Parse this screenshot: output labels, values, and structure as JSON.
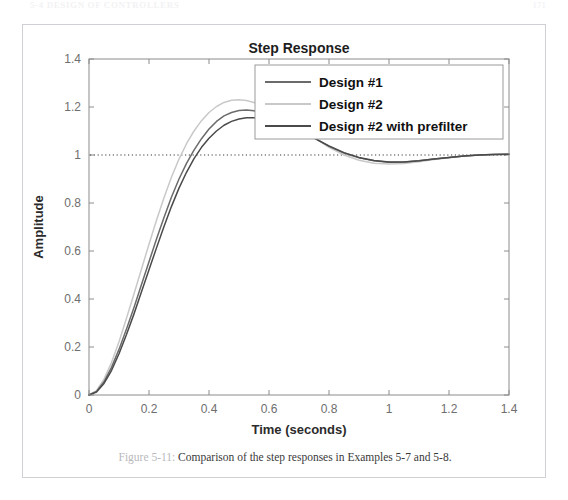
{
  "page_header": {
    "left_text": "5-4  DESIGN OF CONTROLLERS",
    "right_text": "171"
  },
  "caption": {
    "figure_label": "Figure 5-11:",
    "text": " Comparison of the step responses in Examples 5-7 and 5-8."
  },
  "colors": {
    "design1": "#6b6b6b",
    "design2": "#c9c9c9",
    "design2_prefilter": "#4a4a4a",
    "axis": "#8c8c8c",
    "grid": "#d8d8d8",
    "reference_line": "#3a3a3a",
    "frame": "#cfcfd4"
  },
  "chart_data": {
    "type": "line",
    "title": "Step Response",
    "xlabel": "Time (seconds)",
    "ylabel": "Amplitude",
    "xlim": [
      0,
      1.4
    ],
    "ylim": [
      0,
      1.4
    ],
    "xticks": [
      0,
      0.2,
      0.4,
      0.6,
      0.8,
      1,
      1.2,
      1.4
    ],
    "xtick_labels": [
      "0",
      "0.2",
      "0.4",
      "0.6",
      "0.8",
      "1",
      "1.2",
      "1.4"
    ],
    "yticks": [
      0,
      0.2,
      0.4,
      0.6,
      0.8,
      1,
      1.2,
      1.4
    ],
    "ytick_labels": [
      "0",
      "0.2",
      "0.4",
      "0.6",
      "0.8",
      "1",
      "1.2",
      "1.4"
    ],
    "grid": false,
    "legend_position": "top-right",
    "annotations": [
      {
        "type": "horizontal-reference-line",
        "y": 1,
        "style": "dotted"
      }
    ],
    "x": [
      0,
      0.025,
      0.05,
      0.075,
      0.1,
      0.125,
      0.15,
      0.175,
      0.2,
      0.225,
      0.25,
      0.275,
      0.3,
      0.325,
      0.35,
      0.375,
      0.4,
      0.425,
      0.45,
      0.475,
      0.5,
      0.525,
      0.55,
      0.6,
      0.65,
      0.7,
      0.75,
      0.8,
      0.85,
      0.9,
      0.95,
      1.0,
      1.05,
      1.1,
      1.15,
      1.2,
      1.25,
      1.3,
      1.35,
      1.4
    ],
    "series": [
      {
        "name": "Design #1",
        "color": "#6b6b6b",
        "values": [
          0,
          0.015,
          0.055,
          0.115,
          0.19,
          0.275,
          0.365,
          0.46,
          0.555,
          0.65,
          0.74,
          0.825,
          0.9,
          0.965,
          1.02,
          1.068,
          1.108,
          1.14,
          1.163,
          1.177,
          1.185,
          1.187,
          1.184,
          1.168,
          1.142,
          1.108,
          1.072,
          1.036,
          1.008,
          0.988,
          0.976,
          0.97,
          0.971,
          0.976,
          0.983,
          0.99,
          0.996,
          1.0,
          1.002,
          1.003
        ]
      },
      {
        "name": "Design #2",
        "color": "#c9c9c9",
        "values": [
          0,
          0.018,
          0.066,
          0.135,
          0.222,
          0.32,
          0.422,
          0.525,
          0.628,
          0.728,
          0.822,
          0.908,
          0.983,
          1.047,
          1.1,
          1.143,
          1.177,
          1.202,
          1.219,
          1.228,
          1.23,
          1.227,
          1.219,
          1.193,
          1.157,
          1.115,
          1.072,
          1.032,
          1.0,
          0.978,
          0.966,
          0.962,
          0.965,
          0.972,
          0.981,
          0.989,
          0.996,
          1.0,
          1.003,
          1.004
        ]
      },
      {
        "name": "Design #2 with prefilter",
        "color": "#4a4a4a",
        "values": [
          0,
          0.012,
          0.048,
          0.102,
          0.172,
          0.252,
          0.338,
          0.43,
          0.522,
          0.613,
          0.702,
          0.786,
          0.862,
          0.928,
          0.985,
          1.032,
          1.07,
          1.1,
          1.124,
          1.14,
          1.15,
          1.155,
          1.155,
          1.146,
          1.128,
          1.102,
          1.07,
          1.038,
          1.01,
          0.99,
          0.977,
          0.971,
          0.971,
          0.976,
          0.983,
          0.99,
          0.996,
          1.0,
          1.002,
          1.003
        ]
      }
    ]
  }
}
